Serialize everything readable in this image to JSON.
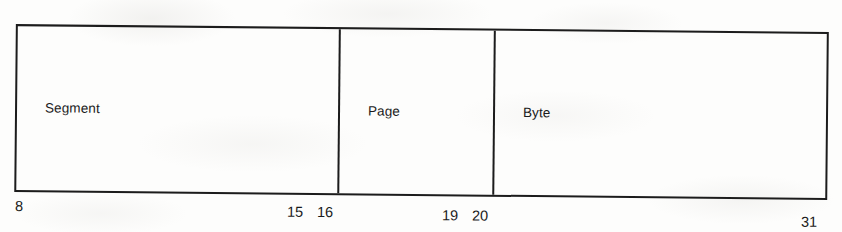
{
  "figure": {
    "caption": "",
    "ink_color": "#1c1c1c",
    "paper_color": "#fdfdfc",
    "fields": [
      {
        "label": "Segment",
        "start_bit": "8",
        "end_bit": "15"
      },
      {
        "label": "Page",
        "start_bit": "16",
        "end_bit": "19"
      },
      {
        "label": "Byte",
        "start_bit": "20",
        "end_bit": "31"
      }
    ],
    "bit_numbers": {
      "segment_start": "8",
      "segment_end": "15",
      "page_start": "16",
      "page_end": "19",
      "byte_start": "20",
      "byte_end": "31"
    }
  }
}
